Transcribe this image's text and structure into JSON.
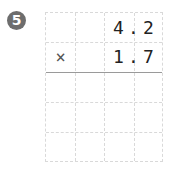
{
  "problem": {
    "number": "5",
    "operator": "×",
    "multiplicand": {
      "digits": [
        "4",
        ".",
        "2"
      ],
      "value": "4.2"
    },
    "multiplier": {
      "digits": [
        "1",
        ".",
        "7"
      ],
      "value": "1.7"
    },
    "answer_rows": 3
  }
}
